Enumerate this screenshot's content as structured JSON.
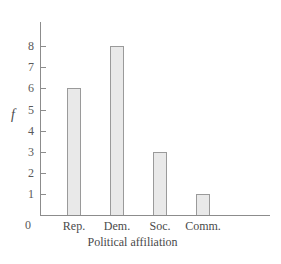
{
  "chart_data": {
    "type": "bar",
    "title": "",
    "subtitle": "",
    "xlabel": "Political affiliation",
    "ylabel": "f",
    "categories": [
      "Rep.",
      "Dem.",
      "Soc.",
      "Comm."
    ],
    "values": [
      6,
      8,
      3,
      1
    ],
    "series": [
      {
        "name": "f",
        "values": [
          6,
          8,
          3,
          1
        ]
      }
    ],
    "ylim": [
      0,
      8
    ],
    "ytick_labels": [
      "0",
      "1",
      "2",
      "3",
      "4",
      "5",
      "6",
      "7",
      "8"
    ],
    "ytick_values": [
      0,
      1,
      2,
      3,
      4,
      5,
      6,
      7,
      8
    ],
    "xtick_labels": [
      "Rep.",
      "Dem.",
      "Soc.",
      "Comm."
    ],
    "grid": false,
    "legend": false,
    "legend_position": "none",
    "annotations": [],
    "colors": {
      "bar_fill": "#e9e9e9",
      "bar_border": "#9a9a9a",
      "axis": "#8c8c8c",
      "text": "#4a4a4a",
      "background": "#ffffff"
    }
  }
}
